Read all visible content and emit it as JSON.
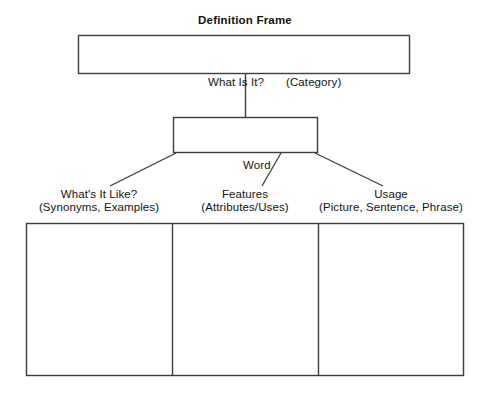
{
  "document": {
    "title": "Definition Frame",
    "type": "graphic-organizer"
  },
  "title": "Definition Frame",
  "top_section": {
    "box_label": "",
    "left_prompt": "What Is It?",
    "right_prompt": "(Category)"
  },
  "middle_section": {
    "box_label": "",
    "caption": "Word"
  },
  "columns": [
    {
      "heading": "What's It Like?",
      "subheading": "(Synonyms, Examples)",
      "content": ""
    },
    {
      "heading": "Features",
      "subheading": "(Attributes/Uses)",
      "content": ""
    },
    {
      "heading": "Usage",
      "subheading": "(Picture, Sentence, Phrase)",
      "content": ""
    }
  ],
  "colors": {
    "background": "#ffffff",
    "stroke": "#3c3c3c",
    "text": "#121212"
  }
}
